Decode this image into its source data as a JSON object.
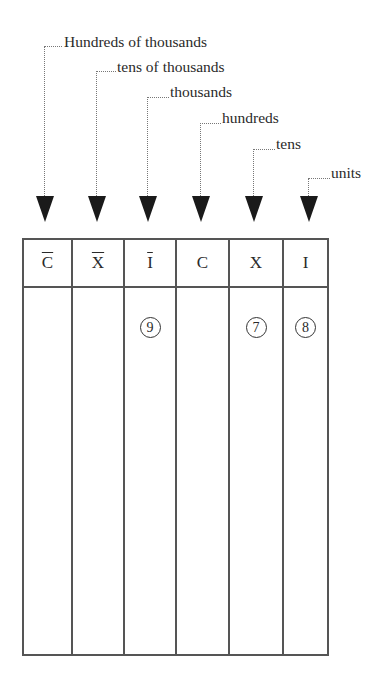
{
  "labels": [
    {
      "text": "Hundreds of thousands"
    },
    {
      "text": "tens of thousands"
    },
    {
      "text": "thousands"
    },
    {
      "text": "hundreds"
    },
    {
      "text": "tens"
    },
    {
      "text": "units"
    }
  ],
  "table": {
    "headers": [
      "C",
      "X",
      "I",
      "C",
      "X",
      "I"
    ],
    "headers_overlined": [
      true,
      true,
      true,
      false,
      false,
      false
    ],
    "values": [
      "",
      "",
      "9",
      "",
      "7",
      "8"
    ]
  }
}
